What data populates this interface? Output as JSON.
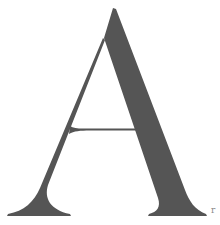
{
  "glyph": {
    "character": "A",
    "style": "high-contrast serif capital",
    "fill_color": "#555555",
    "background_color": "#ffffff"
  },
  "corner_mark": {
    "text": "r",
    "color": "#8a8a8a"
  }
}
